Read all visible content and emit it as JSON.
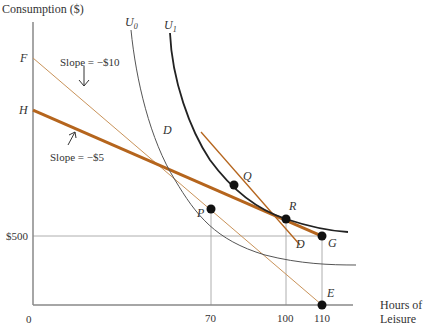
{
  "diagram": {
    "y_axis_label": "Consumption ($)",
    "x_axis_label_line1": "Hours of",
    "x_axis_label_line2": "Leisure",
    "origin_label": "0",
    "y_tick_label": "$500",
    "x_tick_labels": [
      "70",
      "100",
      "110"
    ],
    "point_labels": {
      "F": "F",
      "H": "H",
      "D_top": "D",
      "D_bottom": "D",
      "Q": "Q",
      "R": "R",
      "P": "P",
      "G": "G",
      "E": "E"
    },
    "curves": {
      "U0_label": "U",
      "U0_sub": "0",
      "U1_label": "U",
      "U1_sub": "1"
    },
    "annotations": {
      "slope_fe": "Slope = −$10",
      "slope_hg": "Slope = −$5"
    },
    "colors": {
      "axis": "#888888",
      "budget_hg": "#b5651d",
      "budget_fe": "#c9935a",
      "budget_dd": "#b5651d",
      "indifference_u0": "#555555",
      "indifference_u1": "#222222",
      "points": "#111111",
      "guides": "#999999"
    }
  }
}
